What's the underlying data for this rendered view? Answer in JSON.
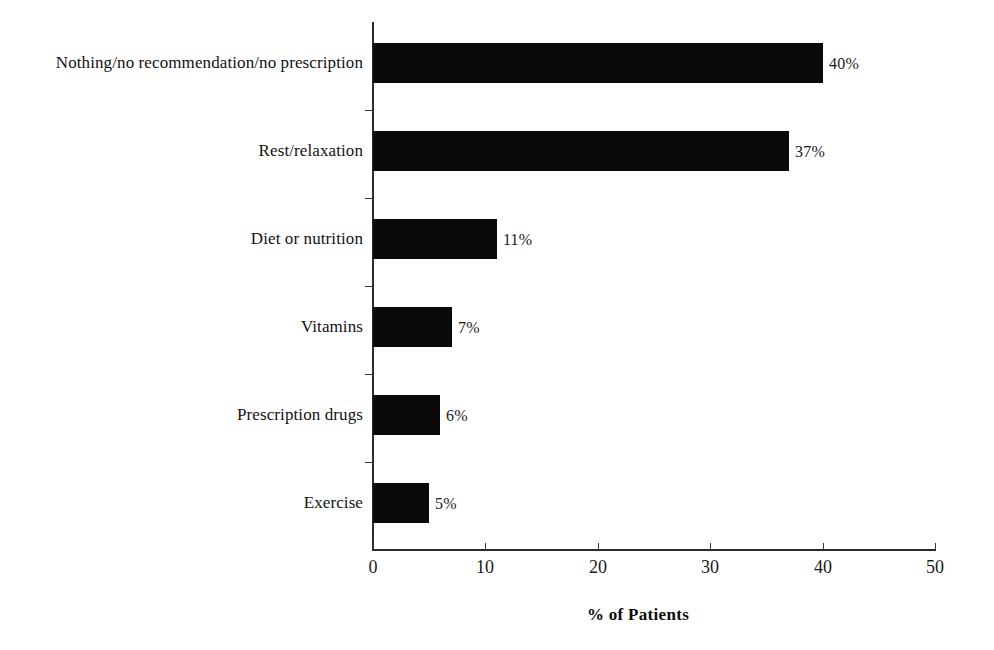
{
  "chart_data": {
    "type": "bar",
    "orientation": "horizontal",
    "title": "",
    "subtitle": "",
    "xlabel": "% of Patients",
    "ylabel": "",
    "xlim": [
      0,
      50
    ],
    "x_ticks": [
      0,
      10,
      20,
      30,
      40,
      50
    ],
    "x_tick_labels": [
      "0",
      "10",
      "20",
      "30",
      "40",
      "50"
    ],
    "grid": false,
    "legend": false,
    "legend_position": "none",
    "bar_color": "#0a0a0a",
    "axis_color": "#2b2b2b",
    "categories": [
      "Nothing/no recommendation/no prescription",
      "Rest/relaxation",
      "Diet or nutrition",
      "Vitamins",
      "Prescription drugs",
      "Exercise"
    ],
    "values": [
      40,
      37,
      11,
      7,
      6,
      5
    ],
    "data_labels": [
      "40%",
      "37%",
      "11%",
      "7%",
      "6%",
      "5%"
    ],
    "annotations": []
  }
}
